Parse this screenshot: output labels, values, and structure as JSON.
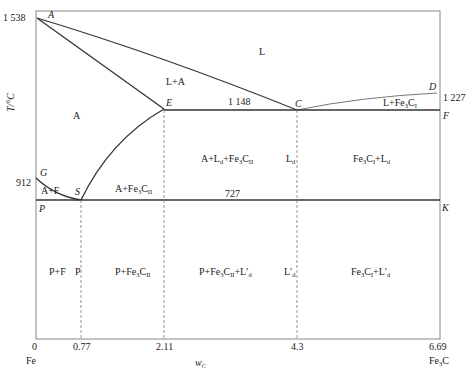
{
  "diagram": {
    "y_axis": {
      "label": "T/°C",
      "ticks": [
        {
          "value": "1 538",
          "y": 18
        },
        {
          "value": "912",
          "y": 183
        }
      ]
    },
    "x_axis": {
      "label": "w_C",
      "label_main": "w",
      "label_sub": "C",
      "ticks": [
        {
          "value": "0",
          "x": 36
        },
        {
          "value": "0.77",
          "x": 81
        },
        {
          "value": "2.11",
          "x": 164
        },
        {
          "value": "4.3",
          "x": 297
        },
        {
          "value": "6.69",
          "x": 440
        }
      ],
      "end_labels": {
        "left": "Fe",
        "right_main": "Fe",
        "right_sub": "3",
        "right_tail": "C"
      }
    },
    "points": {
      "A": "A",
      "E": "E",
      "C": "C",
      "D": "D",
      "F": "F",
      "G": "G",
      "S": "S",
      "P": "P",
      "K": "K"
    },
    "temperatures": {
      "eutectic": "1 148",
      "eutectoid": "727",
      "D": "1 227"
    },
    "regions": {
      "L": "L",
      "L_A": "L+A",
      "A": "A",
      "A_F": "A+F",
      "P_F": "P+F",
      "P": "P",
      "L_Fe3C_I": {
        "main": "L+Fe",
        "sub": "3",
        "tail": "C",
        "roman": "I"
      },
      "A_Fe3C_II": {
        "main": "A+Fe",
        "sub": "3",
        "tail": "C",
        "roman": "II"
      },
      "A_Ld_Fe3C_II": {
        "a": "A+L",
        "ld_sub": "d",
        "b": "+Fe",
        "sub": "3",
        "tail": "C",
        "roman": "II"
      },
      "Ld": {
        "main": "L",
        "sub": "d"
      },
      "Fe3C_I_Ld": {
        "main": "Fe",
        "sub": "3",
        "mid": "C",
        "roman": "I",
        "plus": "+L",
        "ld_sub": "d"
      },
      "P_Fe3C_II": {
        "main": "P+Fe",
        "sub": "3",
        "tail": "C",
        "roman": "II"
      },
      "P_Fe3C_II_Ldp": {
        "main": "P+Fe",
        "sub": "3",
        "tail": "C",
        "roman": "II",
        "plus": "+L′",
        "ld_sub": "d"
      },
      "Ldp": {
        "main": "L′",
        "sub": "d"
      },
      "Fe3C_I_Ldp": {
        "main": "Fe",
        "sub": "3",
        "mid": "C",
        "roman": "I",
        "plus": "+L′",
        "ld_sub": "d"
      }
    },
    "colors": {
      "line": "#333333",
      "dashed": "#777777",
      "frame": "#888888"
    }
  }
}
